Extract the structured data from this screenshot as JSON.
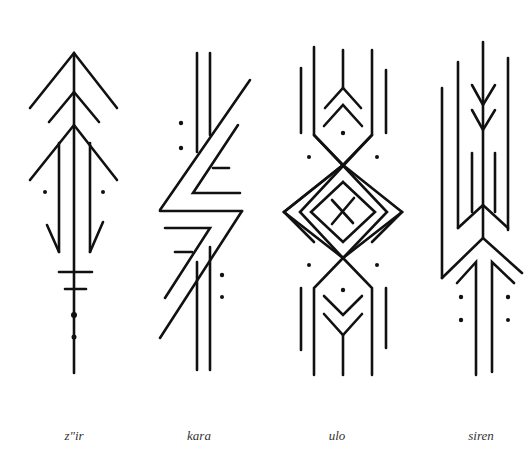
{
  "figure": {
    "background": "#ffffff",
    "stroke_color": "#111111",
    "label_color": "#333333"
  },
  "symbols": [
    {
      "id": "zhir",
      "label": "z\"ir",
      "label_x": 74
    },
    {
      "id": "kara",
      "label": "kara",
      "label_x": 199
    },
    {
      "id": "ulo",
      "label": "ulo",
      "label_x": 337
    },
    {
      "id": "siren",
      "label": "siren",
      "label_x": 481
    }
  ]
}
